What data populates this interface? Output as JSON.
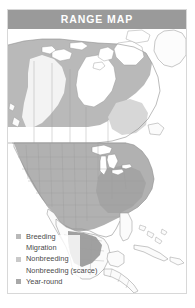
{
  "card": {
    "header": {
      "title": "RANGE MAP"
    },
    "border_color": "#d8d8d8",
    "header_bg": "#9a9a9a",
    "header_text_color": "#ffffff"
  },
  "legend": {
    "items": [
      {
        "label": "Breeding",
        "swatch_color": "#b9b9b9"
      },
      {
        "label": "Migration",
        "swatch_color": "#ffffff"
      },
      {
        "label": "Nonbreeding",
        "swatch_color": "#c9c9c9"
      },
      {
        "label": "Nonbreeding (scarce)",
        "swatch_color": "#ffffff"
      },
      {
        "label": "Year-round",
        "swatch_color": "#a8a8a8"
      }
    ]
  },
  "map": {
    "region": "North America",
    "water_color": "#ffffff",
    "land_outline_color": "#8f8f8f",
    "border_line_color": "#9c9c9c",
    "fills": {
      "breeding": "#b9b9b9",
      "migration": "#ffffff",
      "nonbreeding": "#c9c9c9",
      "nonbreeding_scarce": "#ffffff",
      "year_round": "#a8a8a8",
      "unshaded_land": "#fbfbfb"
    },
    "features": [
      "Alaska",
      "Canada",
      "Greenland",
      "Hudson Bay",
      "Great Lakes",
      "Contiguous United States",
      "Mexico",
      "Central America",
      "Cuba",
      "Bahamas",
      "Caribbean islands"
    ]
  }
}
